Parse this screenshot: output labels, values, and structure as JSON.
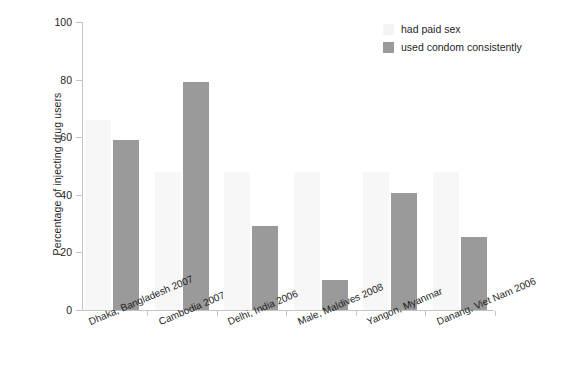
{
  "chart_data": {
    "type": "bar",
    "title": "",
    "subtitle": "",
    "xlabel": "",
    "ylabel": "Percentage of injecting drug users",
    "ylim": [
      0,
      100
    ],
    "yticks": [
      0,
      20,
      40,
      60,
      80,
      100
    ],
    "ytick_labels": [
      "0",
      "20",
      "40",
      "60",
      "80",
      "100"
    ],
    "grid": false,
    "legend_position": "top-right",
    "categories": [
      "Dhaka, Bangladesh 2007",
      "Cambodia 2007",
      "Delhi, India 2006",
      "Male, Maldives 2008",
      "Yangon, Myanmar",
      "Danang, Viet Nam 2006"
    ],
    "series": [
      {
        "name": "had paid sex",
        "color": "#f7f7f7",
        "values": [
          66,
          48,
          48,
          48,
          48,
          48
        ]
      },
      {
        "name": "used condom consistently",
        "color": "#9a9a9a",
        "values": [
          59,
          79,
          29,
          10.5,
          40.5,
          25.5
        ]
      }
    ]
  },
  "legend": {
    "items": [
      {
        "label": "had paid sex",
        "swatch": "paid"
      },
      {
        "label": "used condom consistently",
        "swatch": "condom"
      }
    ]
  },
  "colors": {
    "paid_sex": "#f7f7f7",
    "used_condom": "#9a9a9a",
    "axis": "#c4c4c4",
    "text": "#1f1f1f",
    "background": "#ffffff"
  }
}
